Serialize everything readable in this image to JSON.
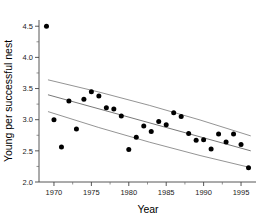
{
  "chart_data": {
    "type": "scatter",
    "title": "",
    "xlabel": "Year",
    "ylabel": "Young per successful nest",
    "xlim": [
      1968.0,
      1997.0
    ],
    "ylim": [
      2.0,
      4.6
    ],
    "grid": false,
    "legend": null,
    "x_ticks": [
      1970,
      1975,
      1980,
      1985,
      1990,
      1995
    ],
    "x_tick_labels": [
      "1970",
      "1975",
      "1980",
      "1985",
      "1990",
      "1995"
    ],
    "x_minor_ticks": [
      1972.5,
      1977.5,
      1982.5,
      1987.5,
      1992.5
    ],
    "y_ticks": [
      2.0,
      2.5,
      3.0,
      3.5,
      4.0,
      4.5
    ],
    "y_tick_labels": [
      "2.0",
      "2.5",
      "3.0",
      "3.5",
      "4.0",
      "4.5"
    ],
    "y_minor_ticks": [
      2.25,
      2.75,
      3.25,
      3.75,
      4.25
    ],
    "marker": "filled-circle",
    "marker_color": "#000000",
    "points": [
      {
        "x": 1969,
        "y": 4.5
      },
      {
        "x": 1970,
        "y": 3.0
      },
      {
        "x": 1971,
        "y": 2.56
      },
      {
        "x": 1972,
        "y": 3.3
      },
      {
        "x": 1973,
        "y": 2.85
      },
      {
        "x": 1974,
        "y": 3.33
      },
      {
        "x": 1975,
        "y": 3.45
      },
      {
        "x": 1976,
        "y": 3.38
      },
      {
        "x": 1977,
        "y": 3.19
      },
      {
        "x": 1978,
        "y": 3.17
      },
      {
        "x": 1979,
        "y": 3.06
      },
      {
        "x": 1980,
        "y": 2.52
      },
      {
        "x": 1981,
        "y": 2.72
      },
      {
        "x": 1982,
        "y": 2.9
      },
      {
        "x": 1983,
        "y": 2.81
      },
      {
        "x": 1984,
        "y": 2.97
      },
      {
        "x": 1985,
        "y": 2.92
      },
      {
        "x": 1986,
        "y": 3.11
      },
      {
        "x": 1987,
        "y": 3.05
      },
      {
        "x": 1988,
        "y": 2.78
      },
      {
        "x": 1989,
        "y": 2.67
      },
      {
        "x": 1990,
        "y": 2.68
      },
      {
        "x": 1991,
        "y": 2.53
      },
      {
        "x": 1992,
        "y": 2.77
      },
      {
        "x": 1993,
        "y": 2.64
      },
      {
        "x": 1994,
        "y": 2.77
      },
      {
        "x": 1995,
        "y": 2.6
      },
      {
        "x": 1996,
        "y": 2.23
      }
    ],
    "fit_line": {
      "name": "regression-line",
      "x": [
        1969.2,
        1996.3
      ],
      "y": [
        3.4,
        2.5
      ]
    },
    "confidence_upper": {
      "name": "upper-confidence-band",
      "x": [
        1969.2,
        1996.3
      ],
      "y": [
        3.64,
        2.74
      ]
    },
    "confidence_lower": {
      "name": "lower-confidence-band",
      "x": [
        1969.2,
        1996.3
      ],
      "y": [
        3.13,
        2.23
      ]
    },
    "accent_color": "#000000"
  }
}
